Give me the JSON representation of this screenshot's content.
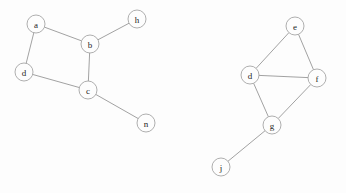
{
  "diagram": {
    "type": "node-link-graph",
    "width": 346,
    "height": 193,
    "background_color": "#fdfdfd",
    "node_fill_color": "#fdfdfd",
    "node_stroke_color": "#9a9a9a",
    "edge_color": "#8a8a8a",
    "label_color": "#1d1d1d",
    "node_radius": 9,
    "nodes": [
      {
        "id": "a",
        "label": "a",
        "x": 36,
        "y": 24,
        "component": 1
      },
      {
        "id": "b",
        "label": "b",
        "x": 90,
        "y": 44,
        "component": 1
      },
      {
        "id": "h",
        "label": "h",
        "x": 137,
        "y": 19,
        "component": 1
      },
      {
        "id": "d",
        "label": "d",
        "x": 24,
        "y": 72,
        "component": 1
      },
      {
        "id": "c",
        "label": "c",
        "x": 88,
        "y": 90,
        "component": 1
      },
      {
        "id": "n",
        "label": "n",
        "x": 146,
        "y": 123,
        "component": 1
      },
      {
        "id": "e",
        "label": "e",
        "x": 295,
        "y": 26,
        "component": 2
      },
      {
        "id": "d2",
        "label": "d",
        "x": 250,
        "y": 75,
        "component": 2
      },
      {
        "id": "f",
        "label": "f",
        "x": 317,
        "y": 78,
        "component": 2
      },
      {
        "id": "g",
        "label": "g",
        "x": 272,
        "y": 125,
        "component": 2
      },
      {
        "id": "j",
        "label": "j",
        "x": 221,
        "y": 167,
        "component": 2
      }
    ],
    "edges": [
      {
        "source": "a",
        "target": "b",
        "component": 1
      },
      {
        "source": "a",
        "target": "d",
        "component": 1
      },
      {
        "source": "b",
        "target": "h",
        "component": 1
      },
      {
        "source": "b",
        "target": "c",
        "component": 1
      },
      {
        "source": "d",
        "target": "c",
        "component": 1
      },
      {
        "source": "c",
        "target": "n",
        "component": 1
      },
      {
        "source": "e",
        "target": "d2",
        "component": 2
      },
      {
        "source": "e",
        "target": "f",
        "component": 2
      },
      {
        "source": "d2",
        "target": "f",
        "component": 2
      },
      {
        "source": "d2",
        "target": "g",
        "component": 2
      },
      {
        "source": "f",
        "target": "g",
        "component": 2
      },
      {
        "source": "g",
        "target": "j",
        "component": 2
      }
    ]
  }
}
